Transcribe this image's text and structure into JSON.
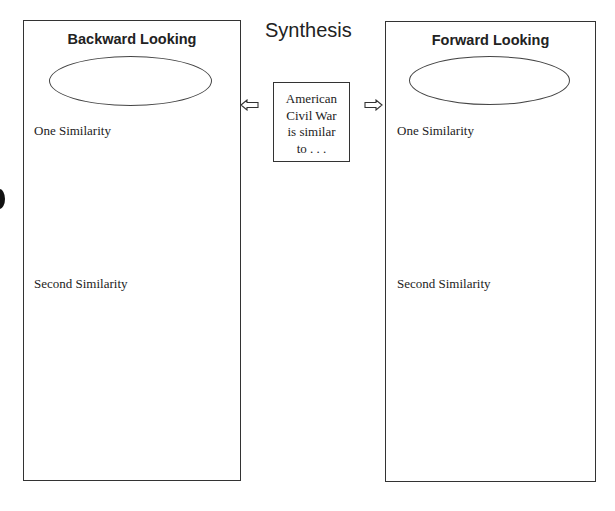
{
  "title": "Synthesis",
  "center": {
    "lines": [
      "American",
      "Civil War",
      "is similar",
      "to . . ."
    ]
  },
  "panels": {
    "left": {
      "heading": "Backward Looking",
      "first_label": "One Similarity",
      "second_label": "Second Similarity"
    },
    "right": {
      "heading": "Forward Looking",
      "first_label": "One Similarity",
      "second_label": "Second Similarity"
    }
  },
  "icons": {
    "left_arrow": "outline-arrow-left-icon",
    "right_arrow": "outline-arrow-right-icon"
  },
  "colors": {
    "stroke": "#333333",
    "text": "#222222",
    "background": "#ffffff"
  }
}
